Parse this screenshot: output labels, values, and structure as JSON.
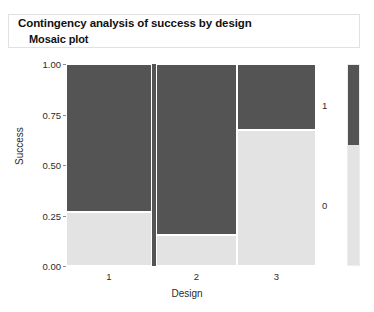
{
  "header": {
    "title": "Contingency analysis of success by design",
    "subtitle": "Mosaic plot"
  },
  "colors": {
    "level_1": "#545454",
    "level_0": "#e3e3e3",
    "tile_border": "#ffffff",
    "axis_text": "#2b2b2b",
    "panel_border": "#ededed"
  },
  "chart_data": {
    "type": "mosaic",
    "title": "Mosaic plot",
    "xlabel": "Design",
    "ylabel": "Success",
    "ylim": [
      0.0,
      1.0
    ],
    "grid": false,
    "legend_position": "right",
    "categories": [
      "1",
      "2",
      "3"
    ],
    "levels": [
      "0",
      "1"
    ],
    "legend_entries": [
      {
        "label": "1",
        "color": "#545454"
      },
      {
        "label": "0",
        "color": "#e3e3e3"
      }
    ],
    "y_ticks": [
      "0.00",
      "0.25",
      "0.50",
      "0.75",
      "1.00"
    ],
    "y_tick_values": [
      0.0,
      0.25,
      0.5,
      0.75,
      1.0
    ],
    "x_ticks": [
      "1",
      "2",
      "3"
    ],
    "columns": [
      {
        "category": "1",
        "width_fraction": 0.344,
        "share_1": 0.735,
        "share_0": 0.265
      },
      {
        "category": "2",
        "width_fraction": 0.324,
        "share_1": 0.845,
        "share_0": 0.155
      },
      {
        "category": "3",
        "width_fraction": 0.316,
        "share_1": 0.325,
        "share_0": 0.675
      }
    ],
    "separator": {
      "width_fraction": 0.016,
      "color": "#545454"
    },
    "legend_split": 0.4
  }
}
